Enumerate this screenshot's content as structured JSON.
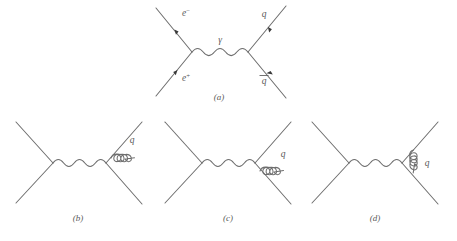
{
  "figure": {
    "line_color": "#6e6e6e",
    "label_color": "#5a5a5a",
    "background": "#ffffff",
    "panels": [
      {
        "id": "a",
        "caption": "(a)",
        "description": "electron-positron annihilation into photon producing quark-antiquark pair",
        "labels": {
          "incoming_top": "e",
          "incoming_top_charge": "−",
          "incoming_bottom": "e",
          "incoming_bottom_charge": "+",
          "mediator": "γ",
          "outgoing_top": "q",
          "outgoing_bottom": "q"
        },
        "outgoing_bottom_has_overbar": true
      },
      {
        "id": "b",
        "caption": "(b)",
        "description": "gluon radiated from outgoing quark line",
        "labels": {
          "gluon": "q"
        }
      },
      {
        "id": "c",
        "caption": "(c)",
        "description": "gluon radiated from outgoing antiquark line",
        "labels": {
          "gluon": "q"
        }
      },
      {
        "id": "d",
        "caption": "(d)",
        "description": "gluon exchanged between quark and antiquark",
        "labels": {
          "gluon": "q"
        }
      }
    ]
  }
}
